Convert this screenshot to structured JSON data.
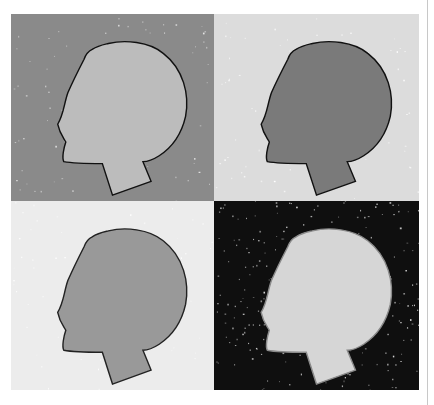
{
  "artwork": {
    "layout": "2x2 grid of head silhouettes (pop-art style)",
    "panels": [
      {
        "position": "top-left",
        "background": "#8a8a8a",
        "head_fill": "#bcbcbc",
        "outline": "#111111",
        "speckle": "#e6e6e6"
      },
      {
        "position": "top-right",
        "background": "#dcdcdc",
        "head_fill": "#7a7a7a",
        "outline": "#111111",
        "speckle": "#ffffff"
      },
      {
        "position": "bottom-left",
        "background": "#ececec",
        "head_fill": "#999999",
        "outline": "#222222",
        "speckle": "#ffffff"
      },
      {
        "position": "bottom-right",
        "background": "#0f0f0f",
        "head_fill": "#d6d6d6",
        "outline": "#8a8a8a",
        "speckle": "#dddddd"
      }
    ]
  }
}
